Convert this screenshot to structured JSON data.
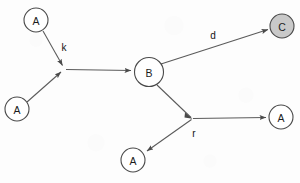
{
  "figure": {
    "kind": "directed-graph",
    "background_color": "#fdfdfd",
    "width": 300,
    "height": 183
  },
  "style": {
    "node_stroke_color": "#4a4a4a",
    "node_fill_default": "#ffffff",
    "node_fill_shaded": "#c9c9c9",
    "edge_color": "#5a5a5a",
    "text_color": "#1c1c1c"
  },
  "nodes": [
    {
      "id": "a-top-left",
      "label": "A",
      "cx": 36,
      "cy": 20,
      "r": 12,
      "shaded": false
    },
    {
      "id": "a-bottom-left",
      "label": "A",
      "cx": 17,
      "cy": 109,
      "r": 12,
      "shaded": false
    },
    {
      "id": "b-center",
      "label": "B",
      "cx": 149,
      "cy": 72,
      "r": 14.5,
      "shaded": false
    },
    {
      "id": "c-top-right",
      "label": "C",
      "cx": 282,
      "cy": 26,
      "r": 12,
      "shaded": true
    },
    {
      "id": "a-right",
      "label": "A",
      "cx": 281,
      "cy": 117,
      "r": 12,
      "shaded": false
    },
    {
      "id": "a-bottom",
      "label": "A",
      "cx": 133,
      "cy": 160,
      "r": 12,
      "shaded": false
    }
  ],
  "junctions": [
    {
      "id": "junction-left",
      "x": 65,
      "y": 69
    },
    {
      "id": "junction-right",
      "x": 192,
      "y": 119
    }
  ],
  "edges": [
    {
      "id": "edge-a-top-left-to-junction-left",
      "from": "a-top-left",
      "to": "junction-left",
      "label": "",
      "arrow": true
    },
    {
      "id": "edge-a-bottom-left-to-junction-left",
      "from": "a-bottom-left",
      "to": "junction-left",
      "label": "",
      "arrow": true
    },
    {
      "id": "edge-junction-left-to-b",
      "from": "junction-left",
      "to": "b-center",
      "label": "",
      "arrow": true
    },
    {
      "id": "edge-b-to-c",
      "from": "b-center",
      "to": "c-top-right",
      "label": "",
      "arrow": true
    },
    {
      "id": "edge-b-to-junction-right",
      "from": "b-center",
      "to": "junction-right",
      "label": "",
      "arrow": true
    },
    {
      "id": "edge-junction-right-to-a-right",
      "from": "junction-right",
      "to": "a-right",
      "label": "",
      "arrow": true
    },
    {
      "id": "edge-junction-right-to-a-bottom",
      "from": "junction-right",
      "to": "a-bottom",
      "label": "",
      "arrow": true
    }
  ],
  "edge_labels": [
    {
      "id": "label-k",
      "text": "k",
      "x": 64,
      "y": 47
    },
    {
      "id": "label-d",
      "text": "d",
      "x": 213,
      "y": 35
    },
    {
      "id": "label-r",
      "text": "r",
      "x": 194,
      "y": 133
    }
  ]
}
